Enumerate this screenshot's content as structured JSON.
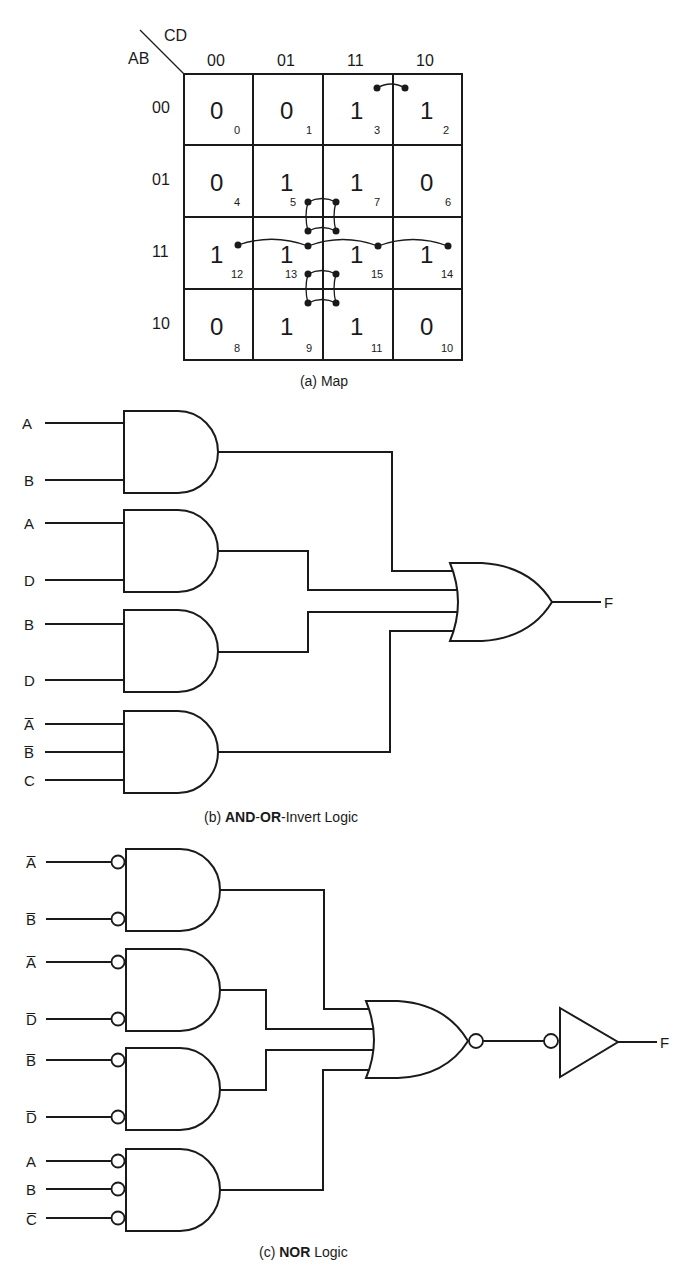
{
  "kmap": {
    "row_var": "AB",
    "col_var": "CD",
    "col_headers": [
      "00",
      "01",
      "11",
      "10"
    ],
    "row_headers": [
      "00",
      "01",
      "11",
      "10"
    ],
    "cells": [
      [
        {
          "v": "0",
          "m": "0"
        },
        {
          "v": "0",
          "m": "1"
        },
        {
          "v": "1",
          "m": "3"
        },
        {
          "v": "1",
          "m": "2"
        }
      ],
      [
        {
          "v": "0",
          "m": "4"
        },
        {
          "v": "1",
          "m": "5"
        },
        {
          "v": "1",
          "m": "7"
        },
        {
          "v": "0",
          "m": "6"
        }
      ],
      [
        {
          "v": "1",
          "m": "12"
        },
        {
          "v": "1",
          "m": "13"
        },
        {
          "v": "1",
          "m": "15"
        },
        {
          "v": "1",
          "m": "14"
        }
      ],
      [
        {
          "v": "0",
          "m": "8"
        },
        {
          "v": "1",
          "m": "9"
        },
        {
          "v": "1",
          "m": "11"
        },
        {
          "v": "0",
          "m": "10"
        }
      ]
    ],
    "groupings": [
      {
        "cells": [
          "3",
          "2"
        ],
        "term": "A'B'C"
      },
      {
        "cells": [
          "5",
          "7",
          "13",
          "15"
        ],
        "term": "BD"
      },
      {
        "cells": [
          "13",
          "15",
          "9",
          "11"
        ],
        "term": "AD"
      },
      {
        "cells": [
          "12",
          "13",
          "15",
          "14"
        ],
        "term": "AB"
      }
    ],
    "caption": "(a) Map"
  },
  "and_or": {
    "gates": [
      {
        "inputs": [
          "A",
          "B"
        ]
      },
      {
        "inputs": [
          "A",
          "D"
        ]
      },
      {
        "inputs": [
          "B",
          "D"
        ]
      },
      {
        "inputs": [
          "A̅",
          "B̅",
          "C"
        ]
      }
    ],
    "output": "F",
    "caption_prefix": "(b) ",
    "caption_bold1": "AND",
    "caption_sep1": "-",
    "caption_bold2": "OR",
    "caption_rest": "-Invert Logic"
  },
  "nor": {
    "gates": [
      {
        "inputs": [
          "A̅",
          "B̅"
        ]
      },
      {
        "inputs": [
          "A̅",
          "D̅"
        ]
      },
      {
        "inputs": [
          "B̅",
          "D̅"
        ]
      },
      {
        "inputs": [
          "A",
          "B",
          "C̅"
        ]
      }
    ],
    "output": "F",
    "caption_prefix": "(c) ",
    "caption_bold": "NOR",
    "caption_rest": " Logic"
  }
}
